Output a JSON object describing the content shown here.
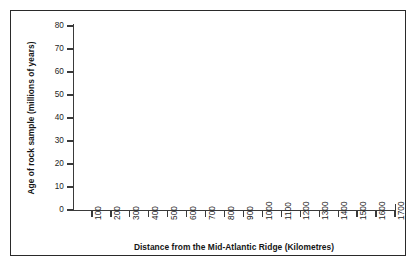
{
  "chart_data": {
    "type": "scatter",
    "title": "",
    "subtitle": "",
    "xlabel": "Distance from the Mid-Atlantic Ridge (Kilometres)",
    "ylabel": "Age of rock sample (millions of years)",
    "xlim": [
      0,
      1700
    ],
    "ylim": [
      0,
      80
    ],
    "xticks": [
      100,
      200,
      300,
      400,
      500,
      600,
      700,
      800,
      900,
      1000,
      1100,
      1200,
      1300,
      1400,
      1500,
      1600,
      1700
    ],
    "xtick_labels": [
      "100",
      "200",
      "300",
      "400",
      "500",
      "600",
      "700",
      "800",
      "900",
      "1000",
      "1100",
      "1200",
      "1300",
      "1400",
      "1500",
      "1600",
      "1700"
    ],
    "yticks": [
      0,
      10,
      20,
      30,
      40,
      50,
      60,
      70,
      80
    ],
    "ytick_labels": [
      "0",
      "10",
      "20",
      "30",
      "40",
      "50",
      "60",
      "70",
      "80"
    ],
    "origin_label": "0",
    "grid": false,
    "legend": false,
    "legend_position": "none",
    "series": [],
    "annotations": []
  },
  "figure": {
    "border_color": "#2a2a2a",
    "axis_color": "#3a3a3a",
    "text_color": "#1d1d1d",
    "title_color": "#151515",
    "background": "#ffffff"
  }
}
